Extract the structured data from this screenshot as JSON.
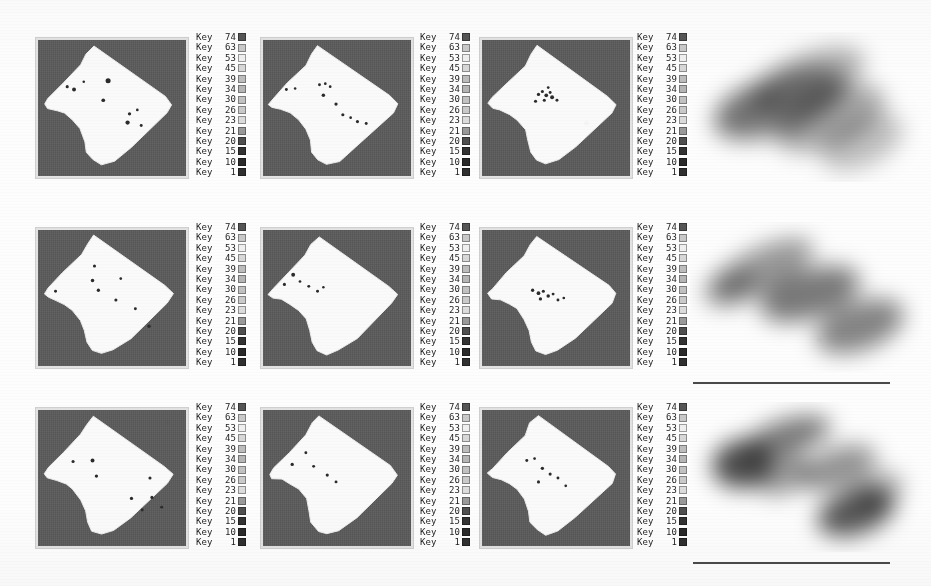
{
  "figure": {
    "title": "",
    "background_color": "#fdfdfd",
    "panel_background_color": "#5b5b5b",
    "segment_fill_color": "#fafafa",
    "marker_color": "#2b2b2b",
    "scalebar_color": "#4a4a4a",
    "rows": 3,
    "columns": 4
  },
  "legend": {
    "label_prefix": "Key",
    "entries": [
      {
        "label": "Key",
        "value": "74",
        "color": "#555555"
      },
      {
        "label": "Key",
        "value": "63",
        "color": "#c9c9c9"
      },
      {
        "label": "Key",
        "value": "53",
        "color": "#f0f0f0"
      },
      {
        "label": "Key",
        "value": "45",
        "color": "#d8d8d8"
      },
      {
        "label": "Key",
        "value": "39",
        "color": "#bdbdbd"
      },
      {
        "label": "Key",
        "value": "34",
        "color": "#b5b5b5"
      },
      {
        "label": "Key",
        "value": "30",
        "color": "#c2c2c2"
      },
      {
        "label": "Key",
        "value": "26",
        "color": "#cacaca"
      },
      {
        "label": "Key",
        "value": "23",
        "color": "#dcdcdc"
      },
      {
        "label": "Key",
        "value": "21",
        "color": "#9a9a9a"
      },
      {
        "label": "Key",
        "value": "20",
        "color": "#4f4f4f"
      },
      {
        "label": "Key",
        "value": "15",
        "color": "#333333"
      },
      {
        "label": "Key",
        "value": "10",
        "color": "#2a2a2a"
      },
      {
        "label": "Key",
        "value": "1",
        "color": "#303030"
      }
    ]
  },
  "panels": [
    {
      "id": "r1c1",
      "name": "segmentation-panel-r1c1",
      "row": 1,
      "column": 1,
      "markers": [
        {
          "x": 30,
          "y": 48,
          "r": 1.6
        },
        {
          "x": 37,
          "y": 51,
          "r": 2.0
        },
        {
          "x": 47,
          "y": 43,
          "r": 1.3
        },
        {
          "x": 72,
          "y": 42,
          "r": 2.6
        },
        {
          "x": 67,
          "y": 62,
          "r": 1.9
        },
        {
          "x": 94,
          "y": 76,
          "r": 1.7
        },
        {
          "x": 102,
          "y": 72,
          "r": 1.4
        },
        {
          "x": 92,
          "y": 85,
          "r": 2.2
        },
        {
          "x": 106,
          "y": 88,
          "r": 1.5
        }
      ]
    },
    {
      "id": "r1c2",
      "name": "segmentation-panel-r1c2",
      "row": 1,
      "column": 2,
      "markers": [
        {
          "x": 24,
          "y": 51,
          "r": 1.5
        },
        {
          "x": 33,
          "y": 50,
          "r": 1.3
        },
        {
          "x": 58,
          "y": 46,
          "r": 1.5
        },
        {
          "x": 64,
          "y": 45,
          "r": 1.4
        },
        {
          "x": 69,
          "y": 48,
          "r": 1.4
        },
        {
          "x": 62,
          "y": 57,
          "r": 1.8
        },
        {
          "x": 75,
          "y": 66,
          "r": 1.7
        },
        {
          "x": 82,
          "y": 77,
          "r": 1.6
        },
        {
          "x": 90,
          "y": 80,
          "r": 1.4
        },
        {
          "x": 97,
          "y": 84,
          "r": 1.6
        },
        {
          "x": 106,
          "y": 86,
          "r": 1.5
        }
      ]
    },
    {
      "id": "r1c3",
      "name": "segmentation-panel-r1c3",
      "row": 1,
      "column": 3,
      "markers": [
        {
          "x": 58,
          "y": 56,
          "r": 1.7
        },
        {
          "x": 62,
          "y": 53,
          "r": 1.6
        },
        {
          "x": 66,
          "y": 57,
          "r": 1.9
        },
        {
          "x": 70,
          "y": 54,
          "r": 1.5
        },
        {
          "x": 72,
          "y": 59,
          "r": 2.0
        },
        {
          "x": 64,
          "y": 62,
          "r": 1.6
        },
        {
          "x": 55,
          "y": 63,
          "r": 1.6
        },
        {
          "x": 77,
          "y": 62,
          "r": 1.5
        },
        {
          "x": 68,
          "y": 49,
          "r": 1.4
        }
      ]
    },
    {
      "id": "r2c1",
      "name": "segmentation-panel-r2c1",
      "row": 2,
      "column": 1,
      "markers": [
        {
          "x": 58,
          "y": 37,
          "r": 1.6
        },
        {
          "x": 56,
          "y": 52,
          "r": 1.8
        },
        {
          "x": 85,
          "y": 50,
          "r": 1.4
        },
        {
          "x": 62,
          "y": 62,
          "r": 1.7
        },
        {
          "x": 18,
          "y": 63,
          "r": 1.5
        },
        {
          "x": 80,
          "y": 72,
          "r": 1.6
        },
        {
          "x": 100,
          "y": 81,
          "r": 1.5
        },
        {
          "x": 114,
          "y": 99,
          "r": 1.8
        }
      ]
    },
    {
      "id": "r2c2",
      "name": "segmentation-panel-r2c2",
      "row": 2,
      "column": 2,
      "markers": [
        {
          "x": 31,
          "y": 46,
          "r": 2.0
        },
        {
          "x": 22,
          "y": 56,
          "r": 1.6
        },
        {
          "x": 38,
          "y": 53,
          "r": 1.4
        },
        {
          "x": 47,
          "y": 58,
          "r": 1.5
        },
        {
          "x": 56,
          "y": 63,
          "r": 1.5
        },
        {
          "x": 62,
          "y": 59,
          "r": 1.3
        }
      ]
    },
    {
      "id": "r2c3",
      "name": "segmentation-panel-r2c3",
      "row": 2,
      "column": 3,
      "markers": [
        {
          "x": 52,
          "y": 62,
          "r": 1.7
        },
        {
          "x": 58,
          "y": 65,
          "r": 1.9
        },
        {
          "x": 63,
          "y": 63,
          "r": 1.6
        },
        {
          "x": 68,
          "y": 68,
          "r": 1.8
        },
        {
          "x": 73,
          "y": 66,
          "r": 1.5
        },
        {
          "x": 60,
          "y": 71,
          "r": 1.7
        },
        {
          "x": 78,
          "y": 72,
          "r": 1.5
        },
        {
          "x": 84,
          "y": 70,
          "r": 1.4
        }
      ]
    },
    {
      "id": "r3c1",
      "name": "segmentation-panel-r3c1",
      "row": 3,
      "column": 1,
      "markers": [
        {
          "x": 36,
          "y": 53,
          "r": 1.6
        },
        {
          "x": 56,
          "y": 52,
          "r": 2.0
        },
        {
          "x": 60,
          "y": 68,
          "r": 1.7
        },
        {
          "x": 115,
          "y": 70,
          "r": 1.6
        },
        {
          "x": 96,
          "y": 91,
          "r": 1.7
        },
        {
          "x": 117,
          "y": 90,
          "r": 1.6
        },
        {
          "x": 107,
          "y": 103,
          "r": 1.5
        },
        {
          "x": 127,
          "y": 100,
          "r": 1.5
        }
      ]
    },
    {
      "id": "r3c2",
      "name": "segmentation-panel-r3c2",
      "row": 3,
      "column": 2,
      "markers": [
        {
          "x": 44,
          "y": 44,
          "r": 1.5
        },
        {
          "x": 30,
          "y": 56,
          "r": 1.7
        },
        {
          "x": 52,
          "y": 58,
          "r": 1.5
        },
        {
          "x": 66,
          "y": 67,
          "r": 1.6
        },
        {
          "x": 75,
          "y": 74,
          "r": 1.5
        }
      ]
    },
    {
      "id": "r3c3",
      "name": "segmentation-panel-r3c3",
      "row": 3,
      "column": 3,
      "markers": [
        {
          "x": 46,
          "y": 52,
          "r": 1.5
        },
        {
          "x": 54,
          "y": 50,
          "r": 1.4
        },
        {
          "x": 62,
          "y": 60,
          "r": 1.7
        },
        {
          "x": 70,
          "y": 66,
          "r": 1.6
        },
        {
          "x": 78,
          "y": 70,
          "r": 1.5
        },
        {
          "x": 58,
          "y": 74,
          "r": 1.6
        },
        {
          "x": 86,
          "y": 78,
          "r": 1.4
        }
      ]
    }
  ],
  "density_maps": [
    {
      "id": "d1",
      "name": "density-map-row1",
      "row": 1,
      "has_scalebar": false,
      "blobs": [
        {
          "cx": 118,
          "cy": 48,
          "rx": 60,
          "ry": 26,
          "rot": -22,
          "intensity": 0.3
        },
        {
          "cx": 90,
          "cy": 72,
          "rx": 70,
          "ry": 30,
          "rot": -20,
          "intensity": 0.42
        },
        {
          "cx": 140,
          "cy": 86,
          "rx": 58,
          "ry": 28,
          "rot": -22,
          "intensity": 0.34
        },
        {
          "cx": 58,
          "cy": 78,
          "rx": 34,
          "ry": 22,
          "rot": -15,
          "intensity": 0.22
        },
        {
          "cx": 172,
          "cy": 110,
          "rx": 44,
          "ry": 24,
          "rot": -25,
          "intensity": 0.24
        }
      ]
    },
    {
      "id": "d2",
      "name": "density-map-row2",
      "row": 2,
      "has_scalebar": true,
      "blobs": [
        {
          "cx": 72,
          "cy": 48,
          "rx": 56,
          "ry": 22,
          "rot": -26,
          "intensity": 0.4
        },
        {
          "cx": 120,
          "cy": 72,
          "rx": 52,
          "ry": 24,
          "rot": -18,
          "intensity": 0.52
        },
        {
          "cx": 170,
          "cy": 104,
          "rx": 46,
          "ry": 24,
          "rot": -20,
          "intensity": 0.48
        },
        {
          "cx": 40,
          "cy": 66,
          "rx": 28,
          "ry": 18,
          "rot": -20,
          "intensity": 0.28
        }
      ]
    },
    {
      "id": "d3",
      "name": "density-map-row3",
      "row": 3,
      "has_scalebar": true,
      "blobs": [
        {
          "cx": 52,
          "cy": 62,
          "rx": 30,
          "ry": 24,
          "rot": -10,
          "intensity": 0.7
        },
        {
          "cx": 98,
          "cy": 34,
          "rx": 44,
          "ry": 17,
          "rot": -16,
          "intensity": 0.52
        },
        {
          "cx": 92,
          "cy": 72,
          "rx": 30,
          "ry": 20,
          "rot": -18,
          "intensity": 0.4
        },
        {
          "cx": 148,
          "cy": 66,
          "rx": 40,
          "ry": 20,
          "rot": -20,
          "intensity": 0.42
        },
        {
          "cx": 166,
          "cy": 110,
          "rx": 40,
          "ry": 22,
          "rot": -18,
          "intensity": 0.66
        },
        {
          "cx": 188,
          "cy": 88,
          "rx": 26,
          "ry": 18,
          "rot": -20,
          "intensity": 0.3
        }
      ]
    }
  ],
  "scalebars": [
    {
      "id": "sb1",
      "name": "scalebar-row2",
      "label": ""
    },
    {
      "id": "sb2",
      "name": "scalebar-row3",
      "label": ""
    }
  ]
}
